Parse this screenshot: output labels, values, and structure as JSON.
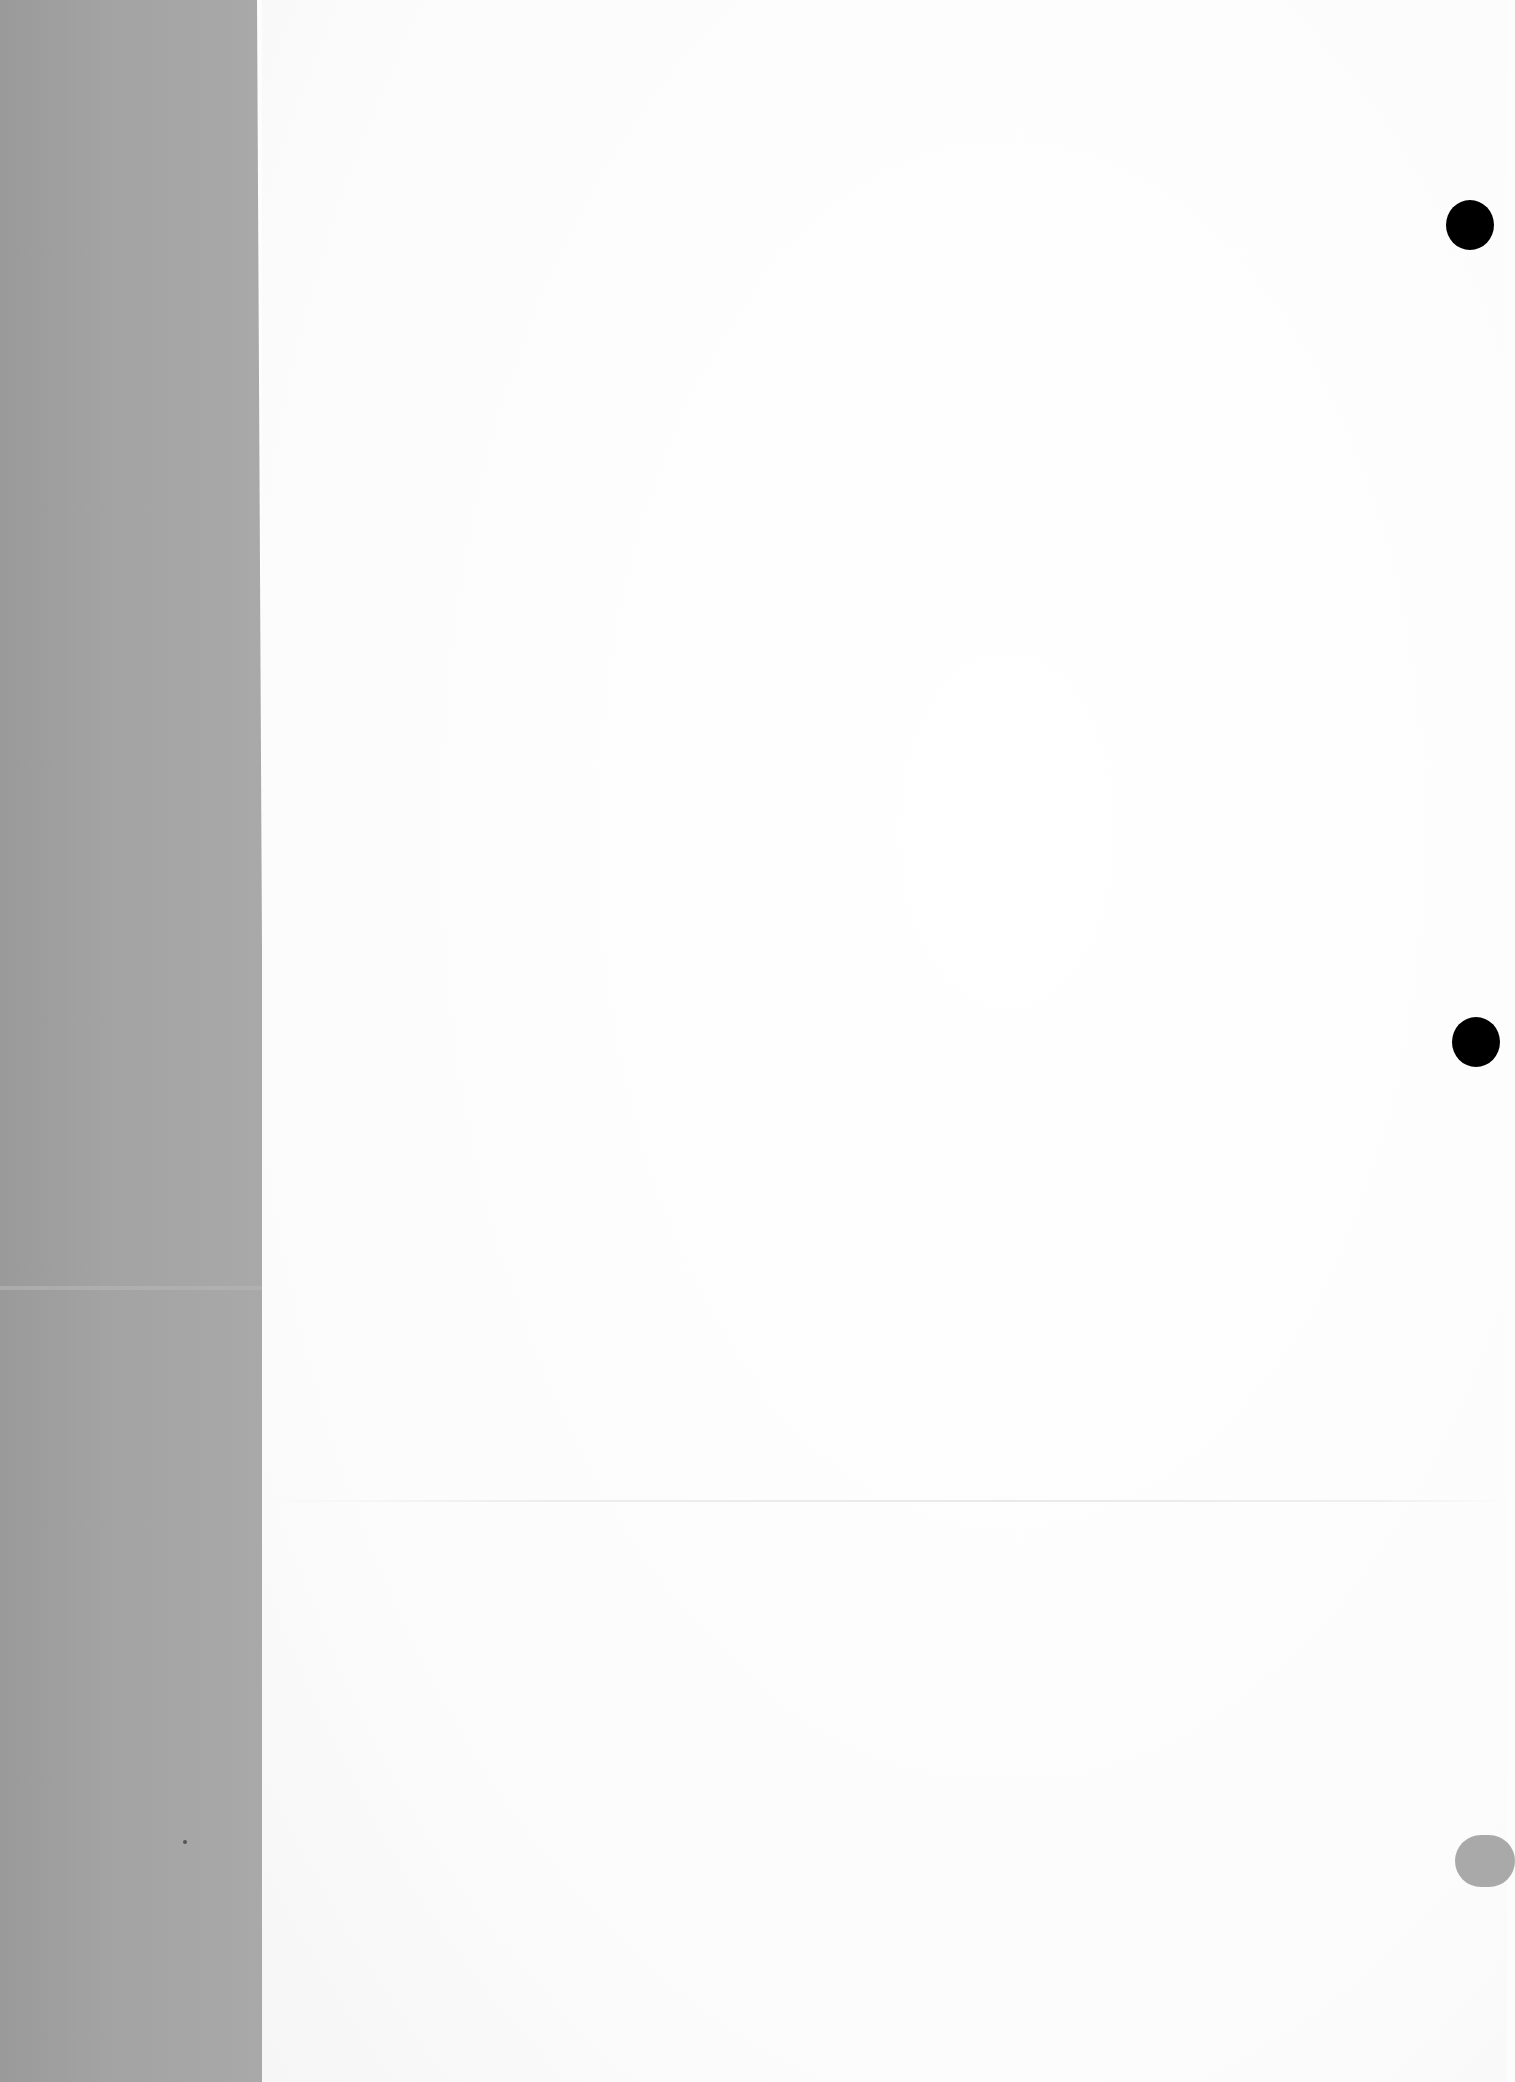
{
  "document": {
    "type": "blank scanned page",
    "page_color": "#fdfdfd",
    "binding_strip_color": "#a3a3a3",
    "text": ""
  },
  "punch_holes": [
    {
      "name": "top",
      "color": "#000000"
    },
    {
      "name": "middle",
      "color": "#000000"
    },
    {
      "name": "bottom",
      "color": "#a9a9a9"
    }
  ]
}
